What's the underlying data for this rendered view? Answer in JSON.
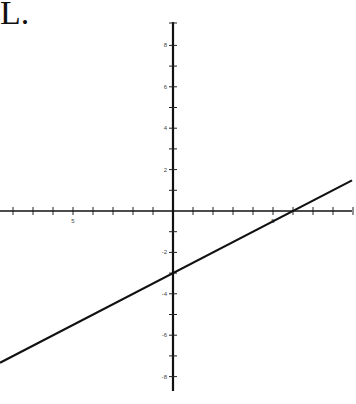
{
  "problem_label": "L.",
  "chart_data": {
    "type": "line",
    "title": "",
    "xlabel": "",
    "ylabel": "",
    "xlim": [
      -8.6,
      9
    ],
    "ylim": [
      -8.6,
      9
    ],
    "grid": false,
    "x_tick_step": 1,
    "y_tick_step": 1,
    "x_tick_labels": [
      {
        "value": -5,
        "text": "5"
      },
      {
        "value": 5,
        "text": "5"
      }
    ],
    "y_tick_labels": [
      {
        "value": 8,
        "text": "8"
      },
      {
        "value": 6,
        "text": "6"
      },
      {
        "value": 4,
        "text": "4"
      },
      {
        "value": 2,
        "text": "2"
      },
      {
        "value": -2,
        "text": "-2"
      },
      {
        "value": -4,
        "text": "-4"
      },
      {
        "value": -6,
        "text": "-6"
      },
      {
        "value": -8,
        "text": "-8"
      }
    ],
    "series": [
      {
        "name": "line",
        "equation": "y = 0.5x - 3",
        "slope": 0.5,
        "intercept": -3,
        "x": [
          -8.65,
          8.95
        ],
        "y": [
          -7.33,
          1.48
        ],
        "color": "#111111"
      }
    ]
  }
}
